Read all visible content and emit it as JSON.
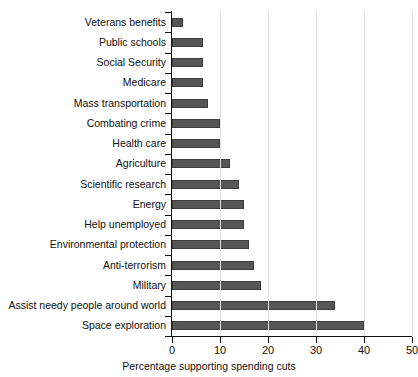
{
  "chart_data": {
    "type": "bar",
    "orientation": "horizontal",
    "title": "",
    "xlabel": "Percentage supporting spending cuts",
    "ylabel": "",
    "xlim": [
      0,
      50
    ],
    "ylim": null,
    "grid": "vertical gridlines at x ticks",
    "legend": "none",
    "bar_color": "#565656",
    "gridline_color": "#e2e2e2",
    "axis_color": "#111111",
    "xticks": [
      0,
      10,
      20,
      30,
      40,
      50
    ],
    "xticklabels": [
      "0",
      "10",
      "20",
      "30",
      "40",
      "50"
    ],
    "categories": [
      "Veterans benefits",
      "Public schools",
      "Social Security",
      "Medicare",
      "Mass transportation",
      "Combating crime",
      "Health care",
      "Agriculture",
      "Scientific research",
      "Energy",
      "Help unemployed",
      "Environmental protection",
      "Anti-terrorism",
      "Military",
      "Assist needy people around world",
      "Space exploration"
    ],
    "values": [
      2.3,
      6.5,
      6.5,
      6.5,
      7.5,
      10,
      10,
      12,
      14,
      15,
      15,
      16,
      17,
      18.5,
      34,
      40
    ]
  }
}
